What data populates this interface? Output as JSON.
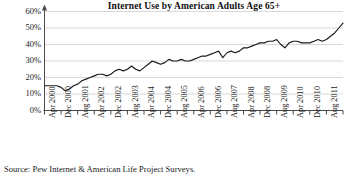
{
  "chart_data": {
    "type": "line",
    "title": "Internet Use by American Adults Age 65+",
    "xlabel": "",
    "ylabel": "",
    "ylim": [
      0,
      60
    ],
    "grid": true,
    "legend": null,
    "ytick_labels": [
      "60%",
      "50%",
      "40%",
      "30%",
      "20%",
      "10%",
      "0%"
    ],
    "ytick_values": [
      60,
      50,
      40,
      30,
      20,
      10,
      0
    ],
    "xtick_labels": [
      "Apr 2000",
      "Dec 2000",
      "Aug 2001",
      "Apr 2002",
      "Dec 2002",
      "Aug 2003",
      "Apr 2004",
      "Dec 2004",
      "Aug 2005",
      "Apr 2006",
      "Dec 2006",
      "Aug 2007",
      "Apr 2008",
      "Dec 2008",
      "Aug 2009",
      "Apr 2010",
      "Dec 2010",
      "Aug 2011",
      "Apr 2012"
    ],
    "series": [
      {
        "name": "Internet use among adults age 65+",
        "x": [
          "Apr 2000",
          "Jun 2000",
          "Aug 2000",
          "Oct 2000",
          "Dec 2000",
          "Feb 2001",
          "Apr 2001",
          "Jun 2001",
          "Aug 2001",
          "Oct 2001",
          "Dec 2001",
          "Feb 2002",
          "Apr 2002",
          "Jun 2002",
          "Aug 2002",
          "Oct 2002",
          "Dec 2002",
          "Feb 2003",
          "Apr 2003",
          "Jun 2003",
          "Aug 2003",
          "Oct 2003",
          "Dec 2003",
          "Feb 2004",
          "Apr 2004",
          "Jun 2004",
          "Aug 2004",
          "Oct 2004",
          "Dec 2004",
          "Feb 2005",
          "Apr 2005",
          "Jun 2005",
          "Aug 2005",
          "Oct 2005",
          "Dec 2005",
          "Feb 2006",
          "Apr 2006",
          "Jun 2006",
          "Aug 2006",
          "Oct 2006",
          "Dec 2006",
          "Feb 2007",
          "Apr 2007",
          "Jun 2007",
          "Aug 2007",
          "Oct 2007",
          "Dec 2007",
          "Feb 2008",
          "Apr 2008",
          "Jun 2008",
          "Aug 2008",
          "Oct 2008",
          "Dec 2008",
          "Feb 2009",
          "Apr 2009",
          "Jun 2009",
          "Aug 2009",
          "Oct 2009",
          "Dec 2009",
          "Feb 2010",
          "Apr 2010",
          "Jun 2010",
          "Aug 2010",
          "Oct 2010",
          "Dec 2010",
          "Feb 2011",
          "Apr 2011",
          "Jun 2011",
          "Aug 2011",
          "Oct 2011",
          "Dec 2011",
          "Feb 2012",
          "Apr 2012"
        ],
        "values": [
          15,
          15,
          15,
          15,
          14,
          12,
          13,
          15,
          16,
          18,
          19,
          20,
          21,
          22,
          22,
          21,
          22,
          24,
          25,
          24,
          25,
          27,
          25,
          24,
          26,
          28,
          30,
          29,
          28,
          29,
          31,
          30,
          30,
          31,
          30,
          30,
          31,
          32,
          33,
          33,
          34,
          35,
          36,
          32,
          35,
          36,
          35,
          36,
          38,
          38,
          39,
          40,
          41,
          41,
          42,
          42,
          43,
          40,
          38,
          41,
          42,
          42,
          41,
          41,
          41,
          42,
          43,
          42,
          43,
          45,
          47,
          50,
          53
        ]
      }
    ]
  },
  "source": {
    "note": "Source: Pew Internet & American Life Project Surveys."
  },
  "style": {
    "line_color": "#1a1a1a",
    "grid_color": "#d8d8d8",
    "axis_color": "#4a4a4a",
    "text_color": "#1a1a1a",
    "background": "#ffffff"
  }
}
